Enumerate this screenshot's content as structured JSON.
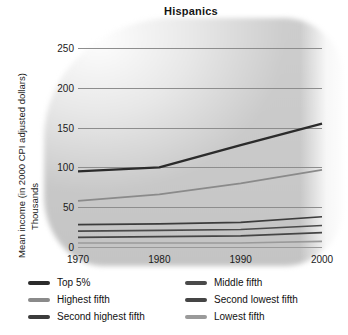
{
  "chart_data": {
    "type": "line",
    "title": "Hispanics",
    "xlabel": "",
    "ylabel": "Mean income (in 2000 CPI adjusted dollars)",
    "ylabel_sub": "Thousands",
    "grid": true,
    "legend_position": "bottom",
    "x": [
      1970,
      1980,
      1990,
      2000
    ],
    "xtick_labels": [
      "1970",
      "1980",
      "1990",
      "2000"
    ],
    "ytick_labels": [
      "0",
      "50",
      "100",
      "150",
      "200",
      "250"
    ],
    "yticks": [
      0,
      50,
      100,
      150,
      200,
      250
    ],
    "xlim": [
      1970,
      2000
    ],
    "ylim": [
      0,
      250
    ],
    "series": [
      {
        "name": "Top 5%",
        "values": [
          95,
          100,
          128,
          155
        ],
        "color": "#2b2b2b"
      },
      {
        "name": "Highest fifth",
        "values": [
          58,
          66,
          80,
          97
        ],
        "color": "#8a8a8a"
      },
      {
        "name": "Second highest fifth",
        "values": [
          28,
          29,
          31,
          38
        ],
        "color": "#3c3c3c"
      },
      {
        "name": "Middle fifth",
        "values": [
          20,
          21,
          22,
          27
        ],
        "color": "#4a4a4a"
      },
      {
        "name": "Second lowest fifth",
        "values": [
          12,
          13,
          14,
          18
        ],
        "color": "#454545"
      },
      {
        "name": "Lowest fifth",
        "values": [
          5,
          5,
          5,
          7
        ],
        "color": "#9a9a9a"
      }
    ]
  },
  "legend": {
    "columns": [
      [
        {
          "label": "Top 5%",
          "color": "#2b2b2b"
        },
        {
          "label": "Highest fifth",
          "color": "#8a8a8a"
        },
        {
          "label": "Second highest fifth",
          "color": "#3c3c3c"
        }
      ],
      [
        {
          "label": "Middle fifth",
          "color": "#4a4a4a"
        },
        {
          "label": "Second lowest fifth",
          "color": "#454545"
        },
        {
          "label": "Lowest fifth",
          "color": "#9a9a9a"
        }
      ]
    ]
  }
}
